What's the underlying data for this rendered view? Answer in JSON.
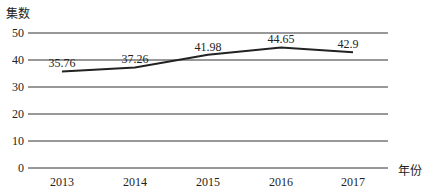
{
  "chart_data": {
    "type": "line",
    "title": "",
    "ylabel": "集数",
    "xlabel": "年份",
    "categories": [
      "2013",
      "2014",
      "2015",
      "2016",
      "2017"
    ],
    "series": [
      {
        "name": "集数",
        "values": [
          35.76,
          37.26,
          41.98,
          44.65,
          42.9
        ]
      }
    ],
    "data_labels": [
      "35.76",
      "37.26",
      "41.98",
      "44.65",
      "42.9"
    ],
    "yticks": [
      0,
      10,
      20,
      30,
      40,
      50
    ],
    "ylim": [
      0,
      50
    ],
    "grid": true,
    "legend": "none"
  },
  "colors": {
    "line": "#222222",
    "grid": "#333333"
  }
}
